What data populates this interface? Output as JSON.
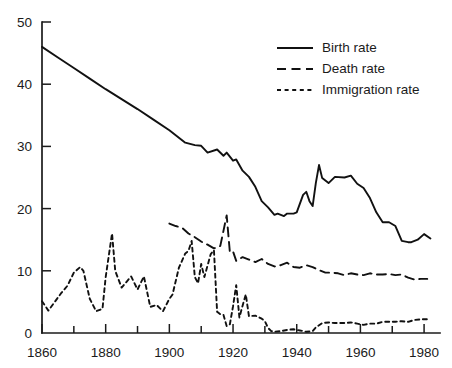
{
  "chart_data": {
    "type": "line",
    "title": "",
    "subtitle": "",
    "xlabel": "",
    "ylabel": "",
    "xlim": [
      1860,
      1985
    ],
    "ylim": [
      0,
      50
    ],
    "x_ticks_major": [
      1860,
      1880,
      1900,
      1920,
      1940,
      1960,
      1980
    ],
    "x_ticks_minor": [
      1870,
      1890,
      1910,
      1930,
      1950,
      1970
    ],
    "y_ticks": [
      0,
      10,
      20,
      30,
      40,
      50
    ],
    "grid": false,
    "legend_position": "top-right",
    "axis_color": "#1b1b1b",
    "line_color": "#111111",
    "series": [
      {
        "name": "Birth rate",
        "style": "solid",
        "x": [
          1860,
          1865,
          1870,
          1875,
          1880,
          1885,
          1890,
          1895,
          1900,
          1905,
          1908,
          1910,
          1912,
          1915,
          1917,
          1918,
          1920,
          1921,
          1923,
          1925,
          1927,
          1929,
          1931,
          1933,
          1934,
          1936,
          1937,
          1939,
          1940,
          1942,
          1943,
          1944,
          1945,
          1946,
          1947,
          1948,
          1950,
          1952,
          1955,
          1957,
          1959,
          1961,
          1963,
          1965,
          1967,
          1969,
          1971,
          1973,
          1975,
          1976,
          1978,
          1980,
          1982
        ],
        "values": [
          46.0,
          44.3,
          42.6,
          40.9,
          39.2,
          37.6,
          36.0,
          34.3,
          32.6,
          30.6,
          30.2,
          30.1,
          29.0,
          29.5,
          28.5,
          29.0,
          27.7,
          27.9,
          26.1,
          25.1,
          23.5,
          21.2,
          20.2,
          19.0,
          19.2,
          18.8,
          19.2,
          19.2,
          19.4,
          22.2,
          22.7,
          21.2,
          20.4,
          24.1,
          27.0,
          24.9,
          24.1,
          25.1,
          25.0,
          25.3,
          24.0,
          23.3,
          21.7,
          19.4,
          17.8,
          17.8,
          17.2,
          14.8,
          14.6,
          14.6,
          15.0,
          15.9,
          15.2
        ]
      },
      {
        "name": "Death rate",
        "style": "dashed",
        "x": [
          1900,
          1902,
          1904,
          1906,
          1908,
          1910,
          1912,
          1914,
          1916,
          1918,
          1919,
          1920,
          1921,
          1923,
          1925,
          1927,
          1929,
          1931,
          1933,
          1935,
          1937,
          1939,
          1941,
          1943,
          1945,
          1947,
          1949,
          1951,
          1953,
          1955,
          1957,
          1959,
          1961,
          1963,
          1965,
          1967,
          1969,
          1971,
          1973,
          1975,
          1977,
          1979,
          1981
        ],
        "values": [
          17.6,
          17.2,
          16.9,
          16.0,
          15.4,
          14.7,
          14.2,
          13.6,
          14.0,
          18.9,
          13.0,
          13.1,
          11.6,
          12.2,
          11.8,
          11.4,
          11.9,
          11.1,
          10.7,
          10.9,
          11.3,
          10.6,
          10.5,
          10.9,
          10.6,
          10.1,
          9.7,
          9.7,
          9.6,
          9.3,
          9.6,
          9.4,
          9.3,
          9.6,
          9.4,
          9.4,
          9.5,
          9.3,
          9.4,
          8.9,
          8.6,
          8.7,
          8.7
        ]
      },
      {
        "name": "Immigration rate",
        "style": "dotted",
        "x": [
          1860,
          1862,
          1864,
          1866,
          1868,
          1870,
          1872,
          1873,
          1875,
          1877,
          1879,
          1880,
          1881,
          1882,
          1883,
          1885,
          1887,
          1888,
          1890,
          1892,
          1894,
          1896,
          1898,
          1900,
          1901,
          1903,
          1905,
          1906,
          1907,
          1908,
          1909,
          1910,
          1911,
          1913,
          1914,
          1915,
          1916,
          1917,
          1918,
          1919,
          1920,
          1921,
          1922,
          1923,
          1924,
          1925,
          1927,
          1929,
          1930,
          1931,
          1932,
          1933,
          1935,
          1937,
          1939,
          1941,
          1943,
          1945,
          1946,
          1948,
          1950,
          1952,
          1955,
          1957,
          1959,
          1961,
          1963,
          1965,
          1967,
          1969,
          1971,
          1973,
          1975,
          1977,
          1979,
          1981
        ],
        "values": [
          5.1,
          3.6,
          5.0,
          6.4,
          7.6,
          9.7,
          10.6,
          10.0,
          5.5,
          3.5,
          3.9,
          9.0,
          12.5,
          16.0,
          10.0,
          7.3,
          8.5,
          9.1,
          7.0,
          9.1,
          4.2,
          4.5,
          3.5,
          5.5,
          6.2,
          10.5,
          12.8,
          13.2,
          14.8,
          9.0,
          8.0,
          11.1,
          9.0,
          12.7,
          13.3,
          3.4,
          3.0,
          2.9,
          1.1,
          1.4,
          4.3,
          7.7,
          2.5,
          4.4,
          6.2,
          2.7,
          2.8,
          2.3,
          1.9,
          0.8,
          0.3,
          0.2,
          0.3,
          0.5,
          0.6,
          0.4,
          0.2,
          0.3,
          0.9,
          1.6,
          1.7,
          1.6,
          1.6,
          1.7,
          1.5,
          1.3,
          1.5,
          1.5,
          1.8,
          1.8,
          1.8,
          1.9,
          1.8,
          2.1,
          2.2,
          2.2
        ]
      }
    ],
    "legend_entries": [
      {
        "label": "Birth rate",
        "style": "solid"
      },
      {
        "label": "Death rate",
        "style": "dashed"
      },
      {
        "label": "Immigration rate",
        "style": "dotted"
      }
    ]
  }
}
